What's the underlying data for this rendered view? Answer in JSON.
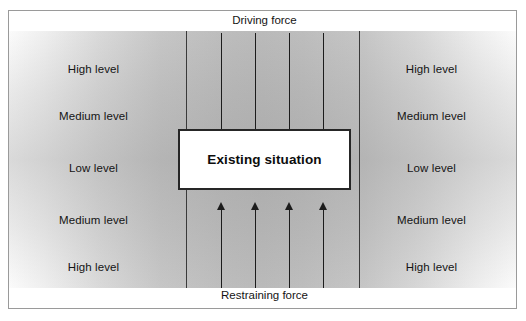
{
  "diagram": {
    "type": "force-field-analysis",
    "center": {
      "box_label": "Existing situation"
    },
    "forces": {
      "driving": {
        "caption": "Driving force",
        "direction": "down",
        "arrow_count": 4
      },
      "restraining": {
        "caption": "Restraining force",
        "direction": "up",
        "arrow_count": 4
      }
    },
    "levels": {
      "left": [
        "High level",
        "Medium level",
        "Low level",
        "Medium level",
        "High level"
      ],
      "right": [
        "High level",
        "Medium level",
        "Low level",
        "Medium level",
        "High level"
      ]
    },
    "colors": {
      "frame_border": "#9a9a9a",
      "box_border": "#262626",
      "box_fill": "#ffffff",
      "arrow": "#1c1c1c",
      "text": "#141414",
      "gradient_light": "#fbfbfb",
      "gradient_dark": "#bababa",
      "background": "#ffffff"
    }
  }
}
